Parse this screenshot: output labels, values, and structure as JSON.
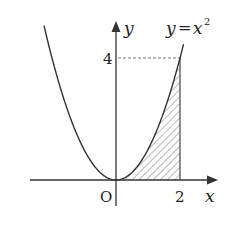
{
  "diagram": {
    "function_label_left": "y",
    "function_label_eq": "=",
    "function_label_base": "x",
    "function_label_exp": "2",
    "axis_x_label": "x",
    "axis_y_label": "y",
    "origin_label": "O",
    "x_tick_label": "2",
    "y_tick_label": "4",
    "curve": "y = x^2",
    "shaded_region": {
      "from_x": 0,
      "to_x": 2,
      "description": "area under y=x^2 from 0 to 2"
    },
    "x_range": [
      -3.6,
      2.2
    ],
    "y_range": [
      0,
      5.2
    ],
    "colors": {
      "stroke": "#333333",
      "text": "#222222"
    }
  }
}
